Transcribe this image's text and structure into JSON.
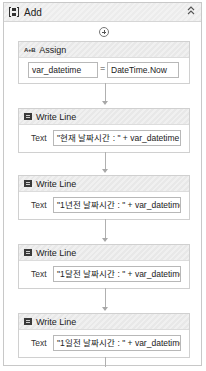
{
  "sequence": {
    "title": "Add",
    "icon": "sequence-icon",
    "collapse_glyph": "˄˄",
    "add_icon": "plus-circle-icon"
  },
  "assign": {
    "title": "Assign",
    "icon_text": "A+B",
    "to_value": "var_datetime",
    "equals": "=",
    "value": "DateTime.Now"
  },
  "write_lines": [
    {
      "title": "Write Line",
      "text_label": "Text",
      "text_value": "\"현재 날짜시간 : \" + var_datetime"
    },
    {
      "title": "Write Line",
      "text_label": "Text",
      "text_value": "\"1년전 날짜시간 : \" + var_datetime"
    },
    {
      "title": "Write Line",
      "text_label": "Text",
      "text_value": "\"1달전 날짜시간 : \" + var_datetime"
    },
    {
      "title": "Write Line",
      "text_label": "Text",
      "text_value": "\"1일전 날짜시간 : \" + var_datetime"
    }
  ]
}
